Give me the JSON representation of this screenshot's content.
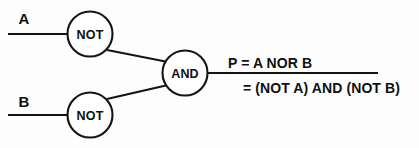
{
  "diagram": {
    "ink_color": "#141414",
    "background_color": "#fdfdfd",
    "inputs": [
      {
        "label": "A",
        "wire_y": 34
      },
      {
        "label": "B",
        "wire_y": 115
      }
    ],
    "gates": [
      {
        "id": "not-a",
        "label": "NOT",
        "cx": 90,
        "cy": 34,
        "r": 22.5
      },
      {
        "id": "not-b",
        "label": "NOT",
        "cx": 90,
        "cy": 115,
        "r": 22.5
      },
      {
        "id": "and",
        "label": "AND",
        "cx": 185,
        "cy": 73,
        "r": 22.5
      }
    ],
    "output": {
      "expression_primary": "P  =  A NOR B",
      "expression_secondary": "= (NOT A) AND (NOT B)",
      "wire_y": 73
    }
  }
}
